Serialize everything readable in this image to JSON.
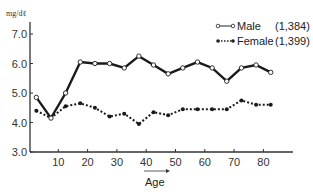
{
  "chart_data": {
    "type": "line",
    "title": "",
    "ylabel": "mg/dℓ",
    "xlabel": "Age",
    "ylim": [
      3.0,
      7.0
    ],
    "xlim": [
      0,
      90
    ],
    "yticks": [
      "3.0",
      "4.0",
      "5.0",
      "6.0",
      "7.0"
    ],
    "xticks": [
      "10",
      "20",
      "30",
      "40",
      "50",
      "60",
      "70",
      "80"
    ],
    "grid": false,
    "legend_position": "top-right",
    "x": [
      2.5,
      7.5,
      12.5,
      17.5,
      22.5,
      27.5,
      32.5,
      37.5,
      42.5,
      47.5,
      52.5,
      57.5,
      62.5,
      67.5,
      72.5,
      77.5,
      82.5
    ],
    "series": [
      {
        "name": "Male",
        "n_label": "(1,384)",
        "marker": "open-circle",
        "line": "solid",
        "values": [
          4.85,
          4.15,
          5.0,
          6.05,
          6.0,
          6.0,
          5.85,
          6.25,
          5.95,
          5.65,
          5.85,
          6.05,
          5.85,
          5.4,
          5.85,
          5.95,
          5.7
        ]
      },
      {
        "name": "Female",
        "n_label": "(1,399)",
        "marker": "filled-circle",
        "line": "dotted",
        "values": [
          4.4,
          4.15,
          4.55,
          4.65,
          4.5,
          4.2,
          4.3,
          3.95,
          4.35,
          4.25,
          4.45,
          4.45,
          4.45,
          4.45,
          4.75,
          4.6,
          4.6
        ]
      }
    ]
  },
  "legend": {
    "male_label": "Male",
    "male_n": "(1,384)",
    "female_label": "Female",
    "female_n": "(1,399)"
  },
  "axes": {
    "unit_label": "mg/dℓ",
    "x_title": "Age"
  }
}
